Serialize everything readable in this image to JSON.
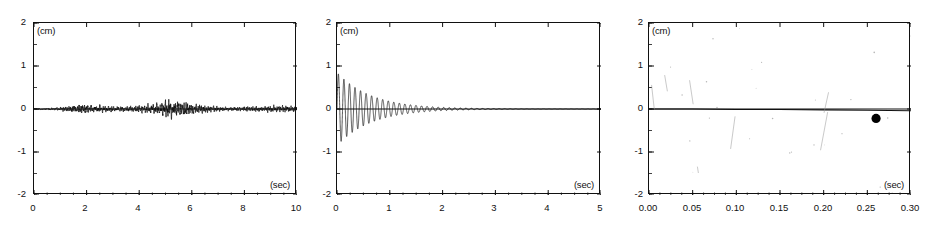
{
  "figure": {
    "width": 937,
    "height": 229,
    "background": "#ffffff",
    "ink_color": "#111111"
  },
  "chart_data": [
    {
      "panel_index": 0,
      "type": "line",
      "title": "",
      "subtitle": "",
      "xlabel": "(sec)",
      "ylabel": "(cm)",
      "xlim": [
        0,
        10
      ],
      "ylim": [
        -2,
        2
      ],
      "xticks": [
        0,
        2,
        4,
        6,
        8,
        10
      ],
      "xtick_labels": [
        "0",
        "2",
        "4",
        "6",
        "8",
        "10"
      ],
      "yticks": [
        -2,
        -1,
        0,
        1,
        2
      ],
      "ytick_labels": [
        "-2",
        "-1",
        "0",
        "1",
        "2"
      ],
      "x_minor_interval": 0.5,
      "y_minor_interval": 0.5,
      "grid": false,
      "legend": null,
      "description": "irregular low-amplitude seismic noise record, envelope peaks near 5-6 sec",
      "series": [
        {
          "name": "ground motion record",
          "color": "#111111",
          "envelope_x": [
            0.0,
            0.8,
            1.4,
            1.8,
            2.2,
            2.8,
            3.4,
            4.0,
            4.4,
            4.8,
            5.1,
            5.4,
            5.8,
            6.2,
            6.8,
            7.4,
            8.0,
            8.6,
            9.2,
            10.0
          ],
          "envelope_y": [
            0.01,
            0.02,
            0.06,
            0.09,
            0.07,
            0.05,
            0.05,
            0.06,
            0.08,
            0.11,
            0.16,
            0.14,
            0.11,
            0.08,
            0.05,
            0.03,
            0.04,
            0.05,
            0.06,
            0.05
          ]
        }
      ]
    },
    {
      "panel_index": 1,
      "type": "line",
      "title": "",
      "subtitle": "",
      "xlabel": "(sec)",
      "ylabel": "(cm)",
      "xlim": [
        0,
        5
      ],
      "ylim": [
        -2,
        2
      ],
      "xticks": [
        0,
        1,
        2,
        3,
        4,
        5
      ],
      "xtick_labels": [
        "0",
        "1",
        "2",
        "3",
        "4",
        "5"
      ],
      "yticks": [
        -2,
        -1,
        0,
        1,
        2
      ],
      "ytick_labels": [
        "-2",
        "-1",
        "0",
        "1",
        "2"
      ],
      "x_minor_interval": 0.25,
      "y_minor_interval": 0.5,
      "grid": false,
      "legend": null,
      "description": "exponentially damped free-vibration decay, initial amplitude about 0.85 cm",
      "series": [
        {
          "name": "damped free vibration",
          "color": "#111111",
          "initial_amplitude": 0.85,
          "decay_constant": 1.55,
          "period_sec": 0.105,
          "envelope_x": [
            0.0,
            0.2,
            0.4,
            0.6,
            0.8,
            1.0,
            1.3,
            1.6,
            2.0,
            2.5,
            3.0,
            3.5,
            4.0,
            4.5,
            5.0
          ],
          "envelope_y": [
            0.85,
            0.62,
            0.46,
            0.34,
            0.25,
            0.18,
            0.115,
            0.072,
            0.038,
            0.017,
            0.008,
            0.004,
            0.002,
            0.001,
            0.001
          ]
        }
      ]
    },
    {
      "panel_index": 2,
      "type": "scatter",
      "title": "",
      "subtitle": "",
      "xlabel": "(sec)",
      "ylabel": "(cm)",
      "xlim": [
        0.0,
        0.3
      ],
      "ylim": [
        -2,
        2
      ],
      "xticks": [
        0.0,
        0.05,
        0.1,
        0.15,
        0.2,
        0.25,
        0.3
      ],
      "xtick_labels": [
        "0.00",
        "0.05",
        "0.10",
        "0.15",
        "0.20",
        "0.25",
        "0.30"
      ],
      "yticks": [
        -2,
        -1,
        0,
        1,
        2
      ],
      "ytick_labels": [
        "-2",
        "-1",
        "0",
        "1",
        "2"
      ],
      "x_minor_interval": 0.0125,
      "y_minor_interval": 0.5,
      "grid": false,
      "legend": null,
      "description": "near-flat baseline trace along zero with faint scan streaks and a single bold filled data point",
      "series": [
        {
          "name": "baseline trace",
          "color": "#111111",
          "x": [
            0.0,
            0.05,
            0.1,
            0.15,
            0.2,
            0.25,
            0.3
          ],
          "y": [
            0.0,
            0.0,
            -0.01,
            -0.01,
            -0.02,
            -0.03,
            -0.04
          ]
        },
        {
          "name": "marked point",
          "color": "#000000",
          "marker": "filled-circle",
          "x": [
            0.26
          ],
          "y": [
            -0.22
          ]
        }
      ],
      "artifacts": [
        {
          "x1": 0.003,
          "y1": 0.55,
          "x2": 0.006,
          "y2": 0.0
        },
        {
          "x1": 0.018,
          "y1": 0.78,
          "x2": 0.021,
          "y2": 0.42
        },
        {
          "x1": 0.0465,
          "y1": 0.66,
          "x2": 0.0505,
          "y2": 0.12
        },
        {
          "x1": 0.0985,
          "y1": -0.18,
          "x2": 0.0935,
          "y2": -0.92
        },
        {
          "x1": 0.2055,
          "y1": 0.38,
          "x2": 0.2005,
          "y2": -0.08
        },
        {
          "x1": 0.2045,
          "y1": -0.08,
          "x2": 0.1965,
          "y2": -0.95
        },
        {
          "x1": 0.0555,
          "y1": -1.35,
          "x2": 0.0565,
          "y2": -1.48
        }
      ]
    }
  ]
}
